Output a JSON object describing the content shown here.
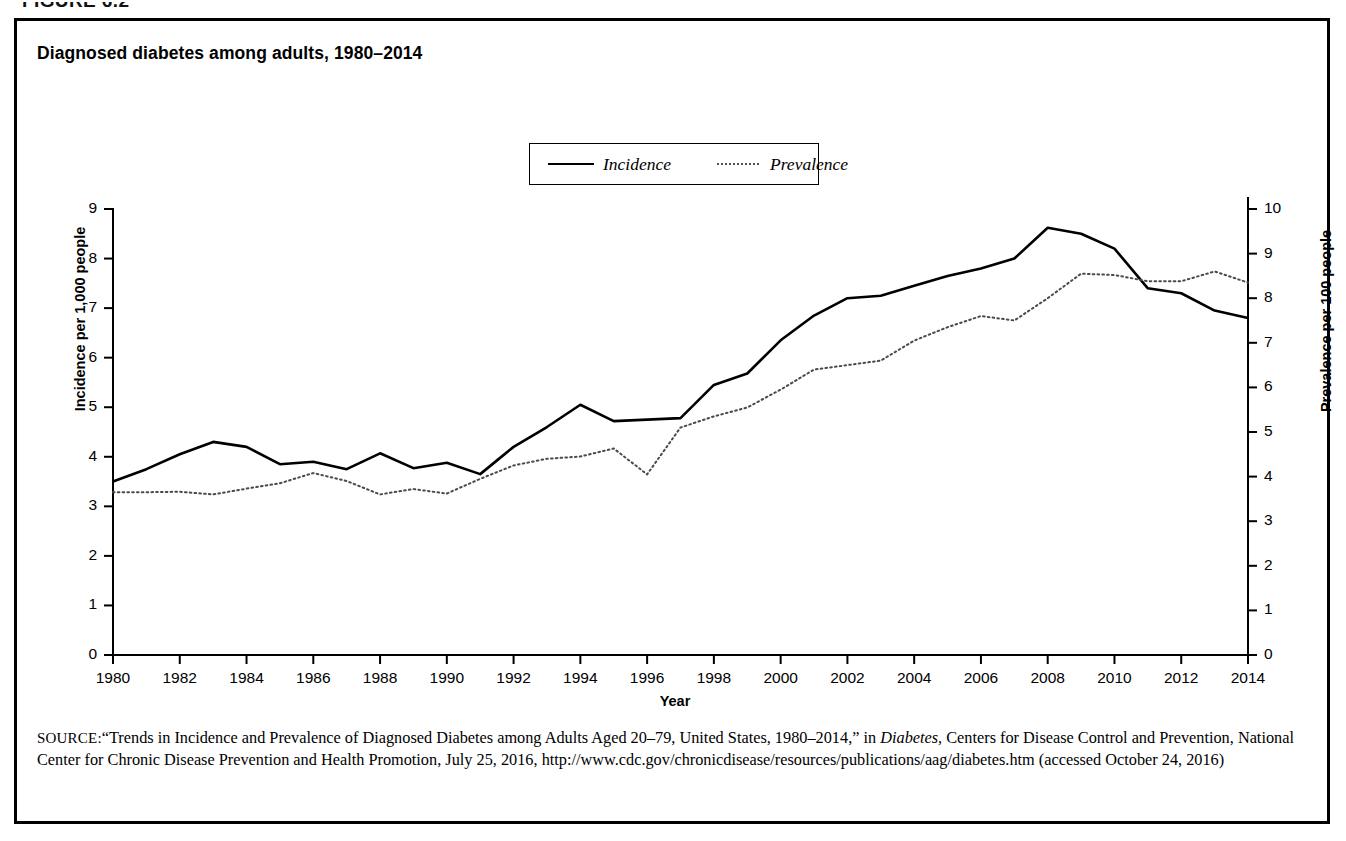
{
  "figure": {
    "number": "FIGURE 6.2"
  },
  "chart_title": "Diagnosed diabetes among adults, 1980–2014",
  "legend": {
    "incidence_label": "Incidence",
    "prevalence_label": "Prevalence"
  },
  "axes": {
    "y_left_title": "Incidence per 1,000 people",
    "y_right_title": "Prevalence per 100 people",
    "x_title": "Year"
  },
  "source": {
    "label": "SOURCE:",
    "text_part1": "“Trends in Incidence and Prevalence of Diagnosed Diabetes among Adults Aged 20–79, United States, 1980–2014,” in ",
    "italic_title": "Diabetes",
    "text_part2": ", Centers for Disease Control and Prevention, National Center for Chronic Disease Prevention and Health Promotion, July 25, 2016, http://www.cdc.gov/chronicdisease/resources/publications/aag/diabetes.htm (accessed October 24, 2016)"
  },
  "chart_data": {
    "type": "line",
    "title": "Diagnosed diabetes among adults, 1980–2014",
    "xlabel": "Year",
    "ylabel": "Incidence per 1,000 people",
    "y2label": "Prevalence per 100 people",
    "xlim": [
      1980,
      2014
    ],
    "ylim": [
      0,
      9
    ],
    "y2lim": [
      0,
      10
    ],
    "yticks": [
      0,
      1,
      2,
      3,
      4,
      5,
      6,
      7,
      8,
      9
    ],
    "y2ticks": [
      0,
      1,
      2,
      3,
      4,
      5,
      6,
      7,
      8,
      9,
      10
    ],
    "xticks": [
      1980,
      1982,
      1984,
      1986,
      1988,
      1990,
      1992,
      1994,
      1996,
      1998,
      2000,
      2002,
      2004,
      2006,
      2008,
      2010,
      2012,
      2014
    ],
    "grid": false,
    "legend_position": "top-center",
    "x": [
      1980,
      1981,
      1982,
      1983,
      1984,
      1985,
      1986,
      1987,
      1988,
      1989,
      1990,
      1991,
      1992,
      1993,
      1994,
      1995,
      1996,
      1997,
      1998,
      1999,
      2000,
      2001,
      2002,
      2003,
      2004,
      2005,
      2006,
      2007,
      2008,
      2009,
      2010,
      2011,
      2012,
      2013,
      2014
    ],
    "series": [
      {
        "name": "Incidence",
        "axis": "left",
        "style": "solid",
        "units": "per 1,000 people",
        "values": [
          3.5,
          3.75,
          4.05,
          4.3,
          4.2,
          3.85,
          3.9,
          3.75,
          4.07,
          3.77,
          3.88,
          3.65,
          4.2,
          4.6,
          5.05,
          4.72,
          4.75,
          4.78,
          5.45,
          5.68,
          6.35,
          6.85,
          7.2,
          7.25,
          7.45,
          7.65,
          7.8,
          8.0,
          8.62,
          8.5,
          8.2,
          7.4,
          7.3,
          6.95,
          6.8
        ]
      },
      {
        "name": "Prevalence",
        "axis": "right",
        "style": "dotted",
        "units": "per 100 people",
        "values": [
          3.65,
          3.65,
          3.66,
          3.6,
          3.73,
          3.85,
          4.08,
          3.9,
          3.6,
          3.72,
          3.62,
          3.95,
          4.25,
          4.4,
          4.45,
          4.63,
          4.05,
          5.1,
          5.35,
          5.55,
          5.95,
          6.4,
          6.5,
          6.6,
          7.05,
          7.35,
          7.6,
          7.5,
          8.0,
          8.55,
          8.52,
          8.38,
          8.38,
          8.6,
          8.35
        ]
      }
    ]
  }
}
